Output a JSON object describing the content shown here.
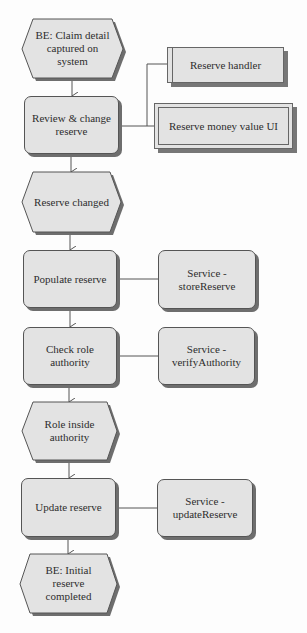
{
  "diagram": {
    "events": [
      {
        "id": "e1",
        "lines": [
          "BE: Claim detail",
          "captured on",
          "system"
        ]
      },
      {
        "id": "e2",
        "lines": [
          "Reserve changed"
        ]
      },
      {
        "id": "e3",
        "lines": [
          "Role inside",
          "authority"
        ]
      },
      {
        "id": "e4",
        "lines": [
          "BE: Initial",
          "reserve",
          "completed"
        ]
      }
    ],
    "functions": [
      {
        "id": "f1",
        "lines": [
          "Review & change",
          "reserve"
        ]
      },
      {
        "id": "f2",
        "lines": [
          "Populate reserve"
        ]
      },
      {
        "id": "f3",
        "lines": [
          "Check role",
          "authority"
        ]
      },
      {
        "id": "f4",
        "lines": [
          "Update reserve"
        ]
      }
    ],
    "services": [
      {
        "id": "s1",
        "lines": [
          "Service -",
          "storeReserve"
        ]
      },
      {
        "id": "s2",
        "lines": [
          "Service -",
          "verifyAuthority"
        ]
      },
      {
        "id": "s3",
        "lines": [
          "Service -",
          "updateReserve"
        ]
      }
    ],
    "systems": [
      {
        "id": "sys1",
        "lines": [
          "Reserve handler"
        ]
      },
      {
        "id": "sys2",
        "lines": [
          "Reserve money value UI"
        ]
      }
    ]
  },
  "colors": {
    "background": "#fdfdfd",
    "shape_fill": "#e3e3e3",
    "shape_border": "#555555",
    "shadow": "#6e6e6e",
    "connector": "#555555",
    "text": "#2e2e2e"
  }
}
